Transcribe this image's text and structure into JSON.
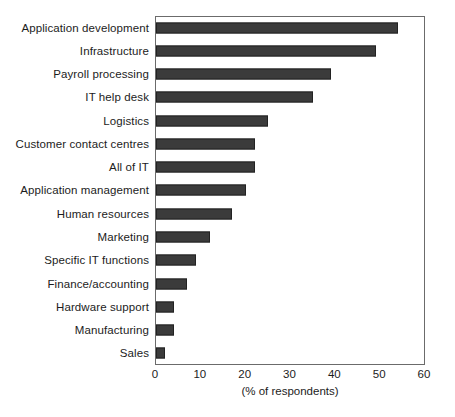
{
  "chart_data": {
    "type": "bar",
    "orientation": "horizontal",
    "title": "",
    "subtitle": "",
    "xlabel": "(% of respondents)",
    "ylabel": "",
    "xlim": [
      0,
      60
    ],
    "xticks": [
      0,
      10,
      20,
      30,
      40,
      50,
      60
    ],
    "xtick_labels": [
      "0",
      "10",
      "20",
      "30",
      "40",
      "50",
      "60"
    ],
    "grid": false,
    "legend": null,
    "legend_position": "none",
    "bar_color": "#3b3b3b",
    "bar_edge_color": "#222222",
    "frame_color": "#6b6b6b",
    "categories": [
      "Application development",
      "Infrastructure",
      "Payroll processing",
      "IT help desk",
      "Logistics",
      "Customer contact centres",
      "All of IT",
      "Application management",
      "Human resources",
      "Marketing",
      "Specific IT functions",
      "Finance/accounting",
      "Hardware support",
      "Manufacturing",
      "Sales"
    ],
    "values": [
      54,
      49,
      39,
      35,
      25,
      22,
      22,
      20,
      17,
      12,
      9,
      7,
      4,
      4,
      2
    ]
  }
}
